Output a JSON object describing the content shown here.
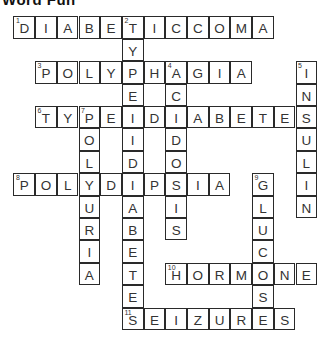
{
  "title": "Word Fun",
  "grid": {
    "cols": 14,
    "rows": 14,
    "cell_w": 21.7,
    "cell_h": 22.4
  },
  "words": [
    {
      "number": 1,
      "answer": "DIABETICCOMA",
      "direction": "across",
      "row": 0,
      "col": 0
    },
    {
      "number": 2,
      "answer": "TYPEIIDIABETES",
      "direction": "down",
      "row": 0,
      "col": 5
    },
    {
      "number": 3,
      "answer": "POLYPHAGIA",
      "direction": "across",
      "row": 2,
      "col": 1
    },
    {
      "number": 4,
      "answer": "ACIDOSIS",
      "direction": "down",
      "row": 2,
      "col": 7
    },
    {
      "number": 5,
      "answer": "INSULIN",
      "direction": "down",
      "row": 2,
      "col": 13
    },
    {
      "number": 6,
      "answer": "TYPEIDIABETES",
      "direction": "across",
      "row": 4,
      "col": 1
    },
    {
      "number": 7,
      "answer": "POLYURIA",
      "direction": "down",
      "row": 4,
      "col": 3
    },
    {
      "number": 8,
      "answer": "POLYDIPSIA",
      "direction": "across",
      "row": 7,
      "col": 0
    },
    {
      "number": 9,
      "answer": "GLUCOSE",
      "direction": "down",
      "row": 7,
      "col": 11
    },
    {
      "number": 10,
      "answer": "HORMONE",
      "direction": "across",
      "row": 11,
      "col": 7
    },
    {
      "number": 11,
      "answer": "SEIZURES",
      "direction": "across",
      "row": 13,
      "col": 5
    }
  ]
}
